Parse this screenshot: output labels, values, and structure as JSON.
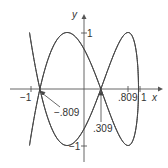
{
  "diagram": {
    "type": "parametric-curve",
    "axes": {
      "x_label": "x",
      "y_label": "y"
    },
    "ticks": {
      "x": [
        {
          "value": -1,
          "label": "−1"
        },
        {
          "value": 0.809,
          "label": ".809"
        },
        {
          "value": 1,
          "label": "1"
        }
      ],
      "y": [
        {
          "value": 1,
          "label": "1"
        },
        {
          "value": -1,
          "label": "−1"
        }
      ]
    },
    "annotations": [
      {
        "label": "−.809",
        "points_to_x": -0.809
      },
      {
        "label": ".309",
        "points_to_x": 0.309
      }
    ],
    "colors": {
      "curve": "#444444",
      "axes": "#555555",
      "background": "#ffffff"
    }
  }
}
